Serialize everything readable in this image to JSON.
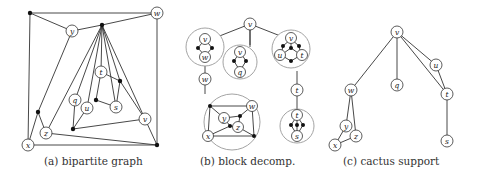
{
  "captions": {
    "a": "(a) bipartite graph",
    "b": "(b) block decomp.",
    "c": "(c) cactus support"
  },
  "labels": {
    "v": "v",
    "w": "w",
    "x": "x",
    "y": "y",
    "z": "z",
    "q": "q",
    "u": "u",
    "t": "t",
    "s": "s"
  },
  "colors": {
    "edge": "#333333",
    "block_circle": "#999999",
    "dot": "#111111",
    "background": "#ffffff"
  }
}
